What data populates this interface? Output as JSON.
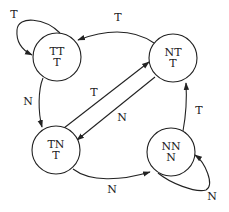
{
  "diagram": {
    "type": "state-transition-diagram",
    "states": [
      {
        "id": "TT",
        "line1": "TT",
        "line2": "T"
      },
      {
        "id": "NT",
        "line1": "NT",
        "line2": "T"
      },
      {
        "id": "TN",
        "line1": "TN",
        "line2": "T"
      },
      {
        "id": "NN",
        "line1": "NN",
        "line2": "N"
      }
    ],
    "transitions": [
      {
        "from": "TT",
        "to": "TT",
        "label": "T"
      },
      {
        "from": "NT",
        "to": "TT",
        "label": "T"
      },
      {
        "from": "TT",
        "to": "TN",
        "label": "N"
      },
      {
        "from": "TN",
        "to": "NT",
        "label": "T"
      },
      {
        "from": "NT",
        "to": "TN",
        "label": "N"
      },
      {
        "from": "TN",
        "to": "NN",
        "label": "N"
      },
      {
        "from": "NN",
        "to": "NT",
        "label": "T"
      },
      {
        "from": "NN",
        "to": "NN",
        "label": "N"
      }
    ]
  }
}
